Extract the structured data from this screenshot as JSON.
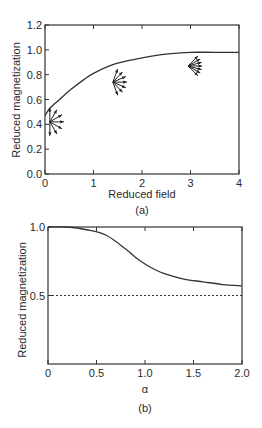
{
  "chart_data": [
    {
      "type": "line",
      "panel_label": "(a)",
      "xlabel": "Reduced field",
      "ylabel": "Reduced magnetization",
      "xlim": [
        0,
        4
      ],
      "ylim": [
        0,
        1.2
      ],
      "xticks": [
        "0",
        "1",
        "2",
        "3",
        "4"
      ],
      "yticks": [
        "0.0",
        "0.2",
        "0.4",
        "0.6",
        "0.8",
        "1.0",
        "1.2"
      ],
      "grid": false,
      "series": [
        {
          "name": "magnetization curve",
          "x": [
            0,
            0.1,
            0.3,
            0.5,
            0.8,
            1.0,
            1.4,
            1.8,
            2.2,
            2.6,
            3.0,
            3.5,
            4.0
          ],
          "y": [
            0.47,
            0.53,
            0.6,
            0.67,
            0.76,
            0.81,
            0.88,
            0.92,
            0.95,
            0.97,
            0.98,
            0.98,
            0.98
          ]
        }
      ],
      "annotations": [
        {
          "type": "spin-fan",
          "x": 0.1,
          "y": 0.42,
          "spread": "wide"
        },
        {
          "type": "spin-fan",
          "x": 1.4,
          "y": 0.74,
          "spread": "medium"
        },
        {
          "type": "spin-fan",
          "x": 2.95,
          "y": 0.87,
          "spread": "narrow"
        }
      ]
    },
    {
      "type": "line",
      "panel_label": "(b)",
      "xlabel": "α",
      "ylabel": "Reduced magnetization",
      "xlim": [
        0,
        2.0
      ],
      "ylim": [
        0,
        1.0
      ],
      "xticks": [
        "0",
        "0.5",
        "1.0",
        "1.5",
        "2.0"
      ],
      "yticks": [
        "0.5",
        "1.0"
      ],
      "grid": false,
      "series": [
        {
          "name": "magnetization vs alpha",
          "style": "solid",
          "x": [
            0,
            0.2,
            0.4,
            0.6,
            0.8,
            0.9,
            1.0,
            1.1,
            1.2,
            1.4,
            1.6,
            1.8,
            2.0
          ],
          "y": [
            1.0,
            1.0,
            0.98,
            0.94,
            0.84,
            0.78,
            0.73,
            0.69,
            0.66,
            0.62,
            0.6,
            0.58,
            0.57
          ]
        },
        {
          "name": "asymptote",
          "style": "dotted",
          "x": [
            0,
            2.0
          ],
          "y": [
            0.5,
            0.5
          ]
        }
      ]
    }
  ]
}
